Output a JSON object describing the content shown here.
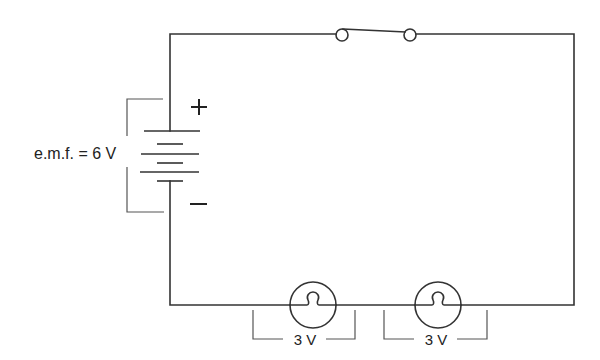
{
  "diagram": {
    "colors": {
      "wire": "#333333",
      "bracket": "#555555",
      "text": "#222222",
      "background": "#ffffff"
    },
    "battery": {
      "label": "e.m.f. = 6 V",
      "positive_symbol": "+",
      "negative_symbol": "−",
      "cells": 3
    },
    "switch": {
      "state": "open"
    },
    "bulbs": [
      {
        "label": "3 V"
      },
      {
        "label": "3 V"
      }
    ]
  }
}
